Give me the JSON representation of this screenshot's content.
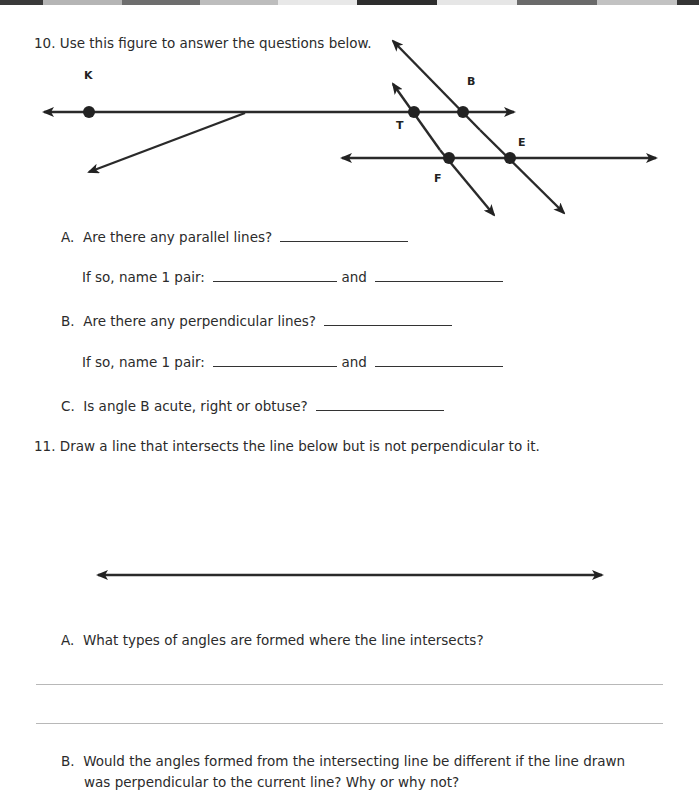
{
  "header_strip": {
    "blocks": [
      {
        "width": 43,
        "color": "#3a3a3a"
      },
      {
        "width": 79,
        "color": "#b5b5b5"
      },
      {
        "width": 78,
        "color": "#6e6e6e"
      },
      {
        "width": 78,
        "color": "#bdbdbd"
      },
      {
        "width": 79,
        "color": "#e8e8e8"
      },
      {
        "width": 80,
        "color": "#2e2e2e"
      },
      {
        "width": 80,
        "color": "#e6e6e6"
      },
      {
        "width": 80,
        "color": "#6a6a6a"
      },
      {
        "width": 80,
        "color": "#c2c2c2"
      },
      {
        "width": 22,
        "color": "#353535"
      }
    ]
  },
  "q10": {
    "number": "10.",
    "prompt": "Use this figure to answer the questions below.",
    "figure": {
      "labels": {
        "K": "K",
        "B": "B",
        "T": "T",
        "E": "E",
        "F": "F"
      }
    },
    "parts": {
      "a": {
        "letter": "A.",
        "question": "Are there any parallel lines?",
        "followup": "If so, name 1 pair:",
        "and": "and"
      },
      "b": {
        "letter": "B.",
        "question": "Are there any perpendicular lines?",
        "followup": "If so, name 1 pair:",
        "and": "and"
      },
      "c": {
        "letter": "C.",
        "question": "Is angle B acute, right or obtuse?"
      }
    }
  },
  "q11": {
    "number": "11.",
    "prompt": "Draw a line that intersects the line below but is not perpendicular to it.",
    "parts": {
      "a": {
        "letter": "A.",
        "question": "What types of angles are formed where the line intersects?"
      },
      "b": {
        "letter": "B.",
        "question_line1": "Would the angles formed from the intersecting line be different if the line drawn",
        "question_line2": "was perpendicular to the current line? Why or why not?"
      }
    }
  }
}
